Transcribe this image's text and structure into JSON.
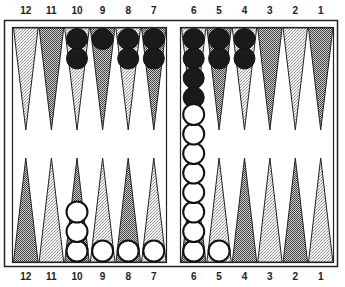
{
  "board": {
    "colors": {
      "frame": "#222222",
      "background": "#ffffff",
      "light_point": "#d8d8d8",
      "dark_point": "#8a8a8a",
      "black_checker": "#1a1a1a",
      "white_checker": "#ffffff"
    },
    "top_labels": [
      "12",
      "11",
      "10",
      "9",
      "8",
      "7",
      "6",
      "5",
      "4",
      "3",
      "2",
      "1"
    ],
    "bottom_labels": [
      "12",
      "11",
      "10",
      "9",
      "8",
      "7",
      "6",
      "5",
      "4",
      "3",
      "2",
      "1"
    ],
    "top_points": [
      {
        "point": "12",
        "shade": "light",
        "checkers": 0,
        "color": "black"
      },
      {
        "point": "11",
        "shade": "dark",
        "checkers": 0,
        "color": "black"
      },
      {
        "point": "10",
        "shade": "light",
        "checkers": 2,
        "color": "black"
      },
      {
        "point": "9",
        "shade": "dark",
        "checkers": 1,
        "color": "black"
      },
      {
        "point": "8",
        "shade": "light",
        "checkers": 2,
        "color": "black"
      },
      {
        "point": "7",
        "shade": "dark",
        "checkers": 2,
        "color": "black"
      },
      {
        "point": "6",
        "shade": "light",
        "checkers": 4,
        "color": "black"
      },
      {
        "point": "5",
        "shade": "dark",
        "checkers": 2,
        "color": "black"
      },
      {
        "point": "4",
        "shade": "light",
        "checkers": 2,
        "color": "black"
      },
      {
        "point": "3",
        "shade": "dark",
        "checkers": 0,
        "color": "black"
      },
      {
        "point": "2",
        "shade": "light",
        "checkers": 0,
        "color": "black"
      },
      {
        "point": "1",
        "shade": "dark",
        "checkers": 0,
        "color": "black"
      }
    ],
    "bottom_points": [
      {
        "point": "12",
        "shade": "dark",
        "checkers": 0,
        "color": "white"
      },
      {
        "point": "11",
        "shade": "light",
        "checkers": 0,
        "color": "white"
      },
      {
        "point": "10",
        "shade": "dark",
        "checkers": 3,
        "color": "white"
      },
      {
        "point": "9",
        "shade": "light",
        "checkers": 1,
        "color": "white"
      },
      {
        "point": "8",
        "shade": "dark",
        "checkers": 1,
        "color": "white"
      },
      {
        "point": "7",
        "shade": "light",
        "checkers": 1,
        "color": "white"
      },
      {
        "point": "6",
        "shade": "dark",
        "checkers": 8,
        "color": "white"
      },
      {
        "point": "5",
        "shade": "light",
        "checkers": 1,
        "color": "white"
      },
      {
        "point": "4",
        "shade": "dark",
        "checkers": 0,
        "color": "white"
      },
      {
        "point": "3",
        "shade": "light",
        "checkers": 0,
        "color": "white"
      },
      {
        "point": "2",
        "shade": "dark",
        "checkers": 0,
        "color": "white"
      },
      {
        "point": "1",
        "shade": "light",
        "checkers": 0,
        "color": "white"
      }
    ]
  }
}
